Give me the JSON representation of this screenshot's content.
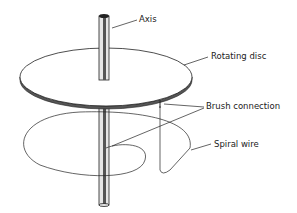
{
  "diagram": {
    "labels": {
      "axis": "Axis",
      "rotating_disc": "Rotating disc",
      "brush_connection": "Brush connection",
      "spiral_wire": "Spiral wire"
    },
    "colors": {
      "background": "#ffffff",
      "line": "#222222",
      "axis_fill": "#cfcfcf"
    }
  }
}
